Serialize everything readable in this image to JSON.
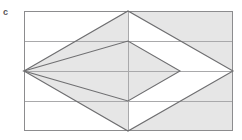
{
  "figure": {
    "label": "c",
    "label_color": "#58585a",
    "background_color": "#ffffff",
    "shade_color": "#e6e6e6",
    "outline_color": "#6e6e70",
    "grid_color": "#a9a9ab",
    "frame_color": "#8c8c8e"
  },
  "geometry": {
    "frame": {
      "x": 24,
      "y": 11,
      "width": 209,
      "height": 120,
      "left": 24,
      "right": 233,
      "top": 11,
      "bottom": 131
    },
    "horizontal_lines_y": [
      41,
      71,
      101
    ],
    "vertical_lines_x": [
      128
    ],
    "band_count": 4,
    "band_height": 30,
    "large_rhombus": {
      "left_vertex": [
        24,
        71
      ],
      "top_vertex": [
        128,
        11
      ],
      "right_vertex": [
        233,
        71
      ],
      "bottom_vertex": [
        128,
        131
      ]
    },
    "small_rhombus": {
      "left_vertex": [
        24,
        71
      ],
      "top_vertex": [
        128,
        41
      ],
      "right_vertex": [
        180,
        71
      ],
      "bottom_vertex": [
        128,
        101
      ]
    },
    "shaded_regions": [
      "small-rhombus-interior",
      "upper-left-triangle-between-rhombi",
      "lower-left-triangle-between-rhombi",
      "upper-right-triangle-outside-large-rhombus",
      "lower-right-triangle-outside-large-rhombus"
    ]
  }
}
